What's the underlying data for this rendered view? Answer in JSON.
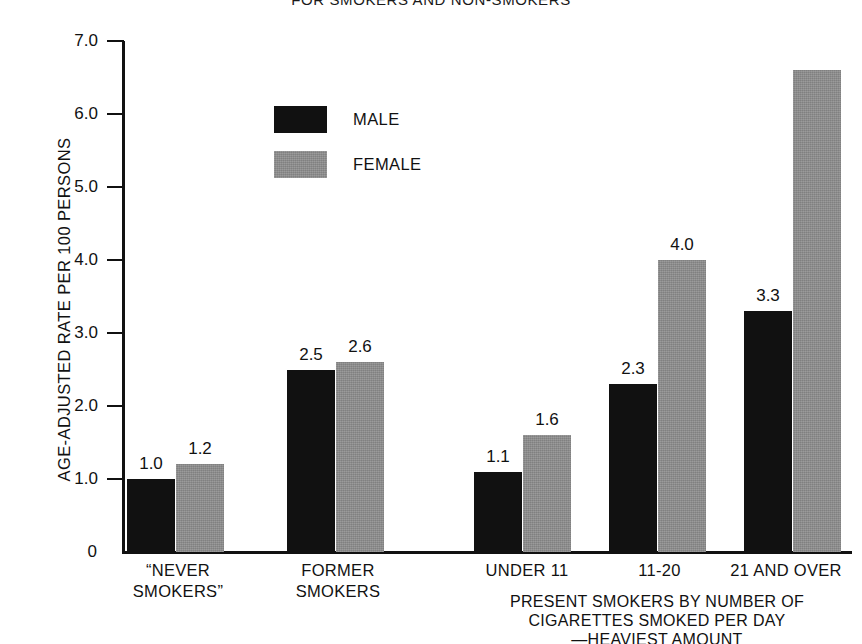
{
  "chart_data": {
    "type": "bar",
    "title": "FOR SMOKERS AND NON-SMOKERS",
    "ylabel": "AGE-ADJUSTED RATE PER 100 PERSONS",
    "xlabel": "PRESENT SMOKERS BY NUMBER OF\nCIGARETTES SMOKED PER DAY\n—HEAVIEST AMOUNT",
    "ylim": [
      0,
      7.0
    ],
    "yticks": [
      "0",
      "1.0",
      "2.0",
      "3.0",
      "4.0",
      "5.0",
      "6.0",
      "7.0"
    ],
    "ytick_values": [
      0,
      1.0,
      2.0,
      3.0,
      4.0,
      5.0,
      6.0,
      7.0
    ],
    "grid": false,
    "legend_position": "upper-left-inside",
    "categories": [
      "“NEVER\nSMOKERS”",
      "FORMER\nSMOKERS",
      "UNDER 11",
      "11-20",
      "21 AND OVER"
    ],
    "series": [
      {
        "name": "MALE",
        "color": "#111111",
        "values": [
          1.0,
          2.5,
          1.1,
          2.3,
          3.3
        ],
        "labels": [
          "1.0",
          "2.5",
          "1.1",
          "2.3",
          "3.3"
        ]
      },
      {
        "name": "FEMALE",
        "color": "#8c8c8c",
        "values": [
          1.2,
          2.6,
          1.6,
          4.0,
          6.6
        ],
        "labels": [
          "1.2",
          "2.6",
          "1.6",
          "4.0",
          ""
        ]
      }
    ]
  },
  "legend": {
    "items": [
      {
        "label": "MALE",
        "color": "#111111"
      },
      {
        "label": "FEMALE",
        "color": "#8c8c8c"
      }
    ]
  },
  "axis": {
    "y_title": "AGE-ADJUSTED RATE PER 100 PERSONS",
    "x_caption": "PRESENT SMOKERS BY NUMBER OF\nCIGARETTES SMOKED PER DAY\n—HEAVIEST AMOUNT"
  },
  "header": {
    "title": "FOR SMOKERS AND NON-SMOKERS"
  }
}
